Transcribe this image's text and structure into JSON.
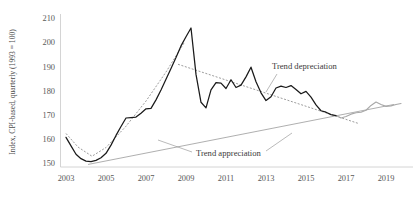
{
  "chart_data": {
    "type": "line",
    "title": "",
    "xlabel": "",
    "ylabel": "Index, CPI-based, quarterly (1993 = 100)",
    "xlim": [
      2003.0,
      2019.75
    ],
    "ylim": [
      150,
      210
    ],
    "grid": false,
    "legend_position": "none",
    "xtick_labels": [
      "2003",
      "2005",
      "2007",
      "2009",
      "2011",
      "2013",
      "2015",
      "2017",
      "2019"
    ],
    "xtick_values": [
      2003,
      2005,
      2007,
      2009,
      2011,
      2013,
      2015,
      2017,
      2019
    ],
    "ytick_labels": [
      "150",
      "160",
      "170",
      "180",
      "190",
      "200",
      "210"
    ],
    "ytick_values": [
      150,
      160,
      170,
      180,
      190,
      200,
      210
    ],
    "annotations": [
      {
        "name": "trend-depreciation",
        "text": "Trend depreciation",
        "x": 2016.1,
        "y": 193.0
      },
      {
        "name": "trend-appreciation",
        "text": "Trend appreciation",
        "x": 2012.6,
        "y": 156.8
      }
    ],
    "series": [
      {
        "name": "Real exchange rate index (observed)",
        "style": "solid-dark",
        "x": [
          2003.0,
          2003.25,
          2003.5,
          2003.75,
          2004.0,
          2004.25,
          2004.5,
          2004.75,
          2005.0,
          2005.25,
          2005.5,
          2005.75,
          2006.0,
          2006.25,
          2006.5,
          2006.75,
          2007.0,
          2007.25,
          2007.5,
          2007.75,
          2008.0,
          2008.25,
          2008.5,
          2008.75,
          2009.0,
          2009.25,
          2009.5,
          2009.75,
          2010.0,
          2010.25,
          2010.5,
          2010.75,
          2011.0,
          2011.25,
          2011.5,
          2011.75,
          2012.0,
          2012.25,
          2012.5,
          2012.75,
          2013.0,
          2013.25,
          2013.5,
          2013.75,
          2014.0,
          2014.25,
          2014.5,
          2014.75,
          2015.0,
          2015.25,
          2015.5,
          2015.75,
          2016.0,
          2016.25,
          2016.5
        ],
        "values": [
          162.0,
          158.5,
          155.0,
          153.2,
          152.2,
          152.0,
          152.5,
          153.6,
          155.4,
          158.8,
          162.8,
          166.5,
          170.0,
          170.2,
          170.4,
          172.0,
          173.8,
          174.0,
          177.5,
          181.6,
          186.0,
          190.5,
          195.0,
          199.8,
          203.6,
          207.2,
          188.0,
          176.5,
          174.2,
          181.6,
          184.6,
          184.4,
          182.2,
          185.8,
          182.6,
          183.6,
          187.0,
          191.0,
          185.0,
          180.4,
          177.2,
          178.8,
          182.4,
          183.2,
          182.6,
          183.4,
          181.8,
          180.0,
          181.0,
          178.6,
          175.4,
          173.0,
          172.4,
          171.4,
          171.0
        ]
      },
      {
        "name": "Real exchange rate index (recent, light)",
        "style": "solid-light",
        "x": [
          2016.5,
          2016.75,
          2017.0,
          2017.25,
          2017.5,
          2017.75,
          2018.0,
          2018.25,
          2018.5,
          2018.75,
          2019.0,
          2019.25,
          2019.5,
          2019.75
        ],
        "values": [
          171.0,
          170.0,
          170.6,
          171.6,
          172.2,
          172.4,
          173.2,
          175.2,
          176.6,
          175.6,
          174.8,
          175.0,
          175.6,
          176.0
        ]
      },
      {
        "name": "Trend appreciation",
        "style": "solid-gray-trend",
        "x": [
          2004.1,
          2019.4
        ],
        "values": [
          150.8,
          175.6
        ]
      },
      {
        "name": "Trend appreciation (early dotted overlay)",
        "style": "dotted-gray",
        "x": [
          2003.0,
          2003.6,
          2004.3,
          2005.0,
          2006.0,
          2007.0,
          2008.0,
          2008.9
        ],
        "values": [
          163.6,
          158.0,
          154.2,
          157.8,
          166.6,
          177.0,
          189.0,
          201.0
        ]
      },
      {
        "name": "Trend depreciation",
        "style": "dotted-gray",
        "x": [
          2008.6,
          2017.6
        ],
        "values": [
          192.2,
          167.8
        ]
      }
    ]
  }
}
